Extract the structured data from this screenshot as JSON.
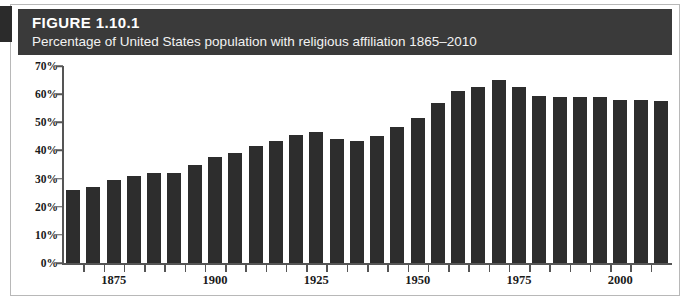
{
  "figure": {
    "label": "FIGURE 1.10.1",
    "subtitle": "Percentage of United States population with religious affiliation 1865–2010"
  },
  "colors": {
    "header_background": "#3a3a3a",
    "header_text": "#ffffff",
    "bar_fill": "#2d2d2d",
    "axis": "#555555",
    "frame": "#b8b8b8",
    "page_background": "#ffffff"
  },
  "chart_data": {
    "type": "bar",
    "title": "Percentage of United States population with religious affiliation 1865–2010",
    "xlabel": "",
    "ylabel": "",
    "ylim": [
      0,
      70
    ],
    "ytick_labels": [
      "0%",
      "10%",
      "20%",
      "30%",
      "40%",
      "50%",
      "60%",
      "70%"
    ],
    "ytick_values": [
      0,
      10,
      20,
      30,
      40,
      50,
      60,
      70
    ],
    "xtick_labels": [
      "1875",
      "1900",
      "1925",
      "1950",
      "1975",
      "2000"
    ],
    "xtick_values": [
      1875,
      1900,
      1925,
      1950,
      1975,
      2000
    ],
    "grid": false,
    "legend": "none",
    "categories": [
      "1865",
      "1870",
      "1875",
      "1880",
      "1885",
      "1890",
      "1895",
      "1900",
      "1905",
      "1910",
      "1915",
      "1920",
      "1925",
      "1930",
      "1935",
      "1940",
      "1945",
      "1950",
      "1955",
      "1960",
      "1965",
      "1970",
      "1975",
      "1980",
      "1985",
      "1990",
      "1995",
      "2000",
      "2005",
      "2010"
    ],
    "values": [
      26,
      27,
      29.5,
      31,
      32,
      32,
      35,
      37.5,
      39,
      41.5,
      43.5,
      45.5,
      46.5,
      44,
      43.5,
      45,
      48.5,
      51.5,
      57,
      61,
      62.5,
      65,
      62.5,
      59.5,
      59,
      59,
      59,
      58,
      58,
      57.5
    ],
    "value_unit": "%"
  }
}
